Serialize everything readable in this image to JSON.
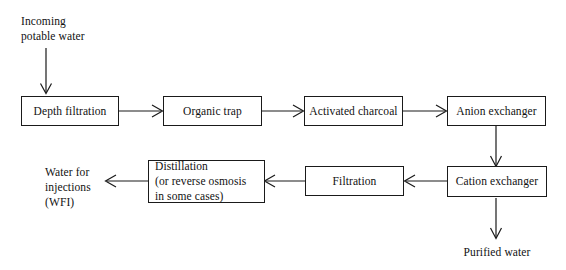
{
  "diagram": {
    "title_text": "",
    "stroke_color": "#1a1a1a",
    "background_color": "#ffffff",
    "text_color": "#111111"
  },
  "labels": {
    "inlet": "Incoming\npotable water",
    "wfi_outlet": "Water for\ninjections\n(WFI)",
    "purified_outlet": "Purified water"
  },
  "nodes": {
    "depth_filtration": "Depth filtration",
    "organic_trap": "Organic trap",
    "activated_charcoal": "Activated charcoal",
    "anion_exchanger": "Anion exchanger",
    "cation_exchanger": "Cation exchanger",
    "filtration": "Filtration",
    "distillation": "Distillation\n(or reverse osmosis\nin some cases)"
  }
}
